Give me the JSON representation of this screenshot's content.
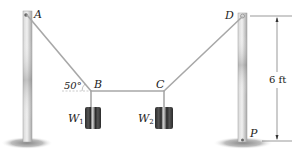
{
  "figure": {
    "points": {
      "A": "A",
      "B": "B",
      "C": "C",
      "D": "D",
      "P": "P"
    },
    "weights": {
      "w1_main": "W",
      "w1_sub": "1",
      "w2_main": "W",
      "w2_sub": "2"
    },
    "angle_label": "50°",
    "dimension_label": "6 ft",
    "colors": {
      "pole": "#c9c9c9",
      "pole_shade": "#8e8e8e",
      "cable": "#a8a8a8",
      "weight": "#3a3a3a",
      "weight_stripe": "#d0d0d0",
      "ground_shadow": "#9a9a9a",
      "text": "#222222"
    }
  }
}
